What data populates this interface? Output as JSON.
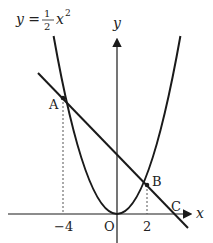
{
  "diagram": {
    "equation": {
      "lhs": "y =",
      "numerator": "1",
      "denominator": "2",
      "var": "x",
      "exponent": "2"
    },
    "axes": {
      "x_label": "x",
      "y_label": "y",
      "origin_label": "O"
    },
    "ticks": {
      "neg4": "−4",
      "pos2": "2"
    },
    "points": {
      "A": "A",
      "B": "B",
      "C": "C"
    },
    "curve": "y = 1/2 x^2",
    "line": "through A(-4, 8) and B(2, 2), meets x-axis at C",
    "colors": {
      "stroke": "#1a1a1a",
      "dashed": "#555555"
    }
  }
}
